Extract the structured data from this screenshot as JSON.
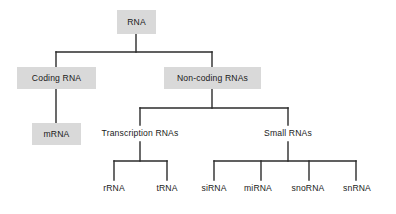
{
  "diagram": {
    "canvas": {
      "width": 396,
      "height": 214,
      "background": "#ffffff"
    },
    "style": {
      "box_fill": "#d9d9d9",
      "text_color": "#1a1a1a",
      "line_color": "#2b2b2b",
      "line_width": 1.4
    },
    "nodes": [
      {
        "id": "rna",
        "label": "RNA",
        "boxed": true,
        "x": 117,
        "y": 10,
        "w": 39,
        "h": 24
      },
      {
        "id": "coding_rna",
        "label": "Coding RNA",
        "boxed": true,
        "x": 17,
        "y": 67,
        "w": 79,
        "h": 22
      },
      {
        "id": "non_coding_rnas",
        "label": "Non-coding RNAs",
        "boxed": true,
        "x": 164,
        "y": 67,
        "w": 97,
        "h": 22
      },
      {
        "id": "mrna",
        "label": "mRNA",
        "boxed": true,
        "x": 32,
        "y": 123,
        "w": 49,
        "h": 22
      },
      {
        "id": "transcription_rnas",
        "label": "Transcription RNAs",
        "boxed": false,
        "x": 92,
        "y": 125,
        "w": 96,
        "h": 17
      },
      {
        "id": "small_rnas",
        "label": "Small RNAs",
        "boxed": false,
        "x": 256,
        "y": 125,
        "w": 64,
        "h": 17
      },
      {
        "id": "rrna",
        "label": "rRNA",
        "boxed": false,
        "x": 95,
        "y": 180,
        "w": 38,
        "h": 16
      },
      {
        "id": "trna",
        "label": "tRNA",
        "boxed": false,
        "x": 148,
        "y": 180,
        "w": 38,
        "h": 16
      },
      {
        "id": "sirna",
        "label": "siRNA",
        "boxed": false,
        "x": 193,
        "y": 180,
        "w": 42,
        "h": 16
      },
      {
        "id": "mirna",
        "label": "miRNA",
        "boxed": false,
        "x": 236,
        "y": 180,
        "w": 44,
        "h": 16
      },
      {
        "id": "snorna",
        "label": "snoRNA",
        "boxed": false,
        "x": 283,
        "y": 180,
        "w": 50,
        "h": 16
      },
      {
        "id": "snrna",
        "label": "snRNA",
        "boxed": false,
        "x": 334,
        "y": 180,
        "w": 46,
        "h": 16
      }
    ],
    "edges": [
      {
        "id": "rna-stem",
        "from": "rna",
        "to": "split-1",
        "points": "136,34 136,52"
      },
      {
        "id": "rna-bar",
        "from": "rna",
        "to": "children-bar-1",
        "points": "56,52 212,52"
      },
      {
        "id": "rna-to-coding",
        "from": "rna",
        "to": "coding_rna",
        "points": "56,52 56,67"
      },
      {
        "id": "rna-to-noncoding",
        "from": "rna",
        "to": "non_coding_rnas",
        "points": "212,52 212,67"
      },
      {
        "id": "coding-to-mrna",
        "from": "coding_rna",
        "to": "mrna",
        "points": "56,89 56,123"
      },
      {
        "id": "noncoding-stem",
        "from": "non_coding_rnas",
        "to": "split-2",
        "points": "212,89 212,108"
      },
      {
        "id": "noncoding-bar",
        "from": "non_coding_rnas",
        "to": "children-bar-2",
        "points": "140,108 288,108"
      },
      {
        "id": "noncoding-to-transc",
        "from": "non_coding_rnas",
        "to": "transcription_rnas",
        "points": "140,108 140,125"
      },
      {
        "id": "noncoding-to-small",
        "from": "non_coding_rnas",
        "to": "small_rnas",
        "points": "288,108 288,125"
      },
      {
        "id": "transc-stem",
        "from": "transcription_rnas",
        "to": "split-3",
        "points": "140,142 140,161"
      },
      {
        "id": "transc-bar",
        "from": "transcription_rnas",
        "to": "children-bar-3",
        "points": "114,161 167,161"
      },
      {
        "id": "transc-to-rrna",
        "from": "transcription_rnas",
        "to": "rrna",
        "points": "114,161 114,180"
      },
      {
        "id": "transc-to-trna",
        "from": "transcription_rnas",
        "to": "trna",
        "points": "167,161 167,180"
      },
      {
        "id": "small-stem",
        "from": "small_rnas",
        "to": "split-4",
        "points": "288,142 288,161"
      },
      {
        "id": "small-bar",
        "from": "small_rnas",
        "to": "children-bar-4",
        "points": "214,161 356,161"
      },
      {
        "id": "small-to-sirna",
        "from": "small_rnas",
        "to": "sirna",
        "points": "214,161 214,180"
      },
      {
        "id": "small-to-mirna",
        "from": "small_rnas",
        "to": "mirna",
        "points": "261,161 261,180"
      },
      {
        "id": "small-to-snorna",
        "from": "small_rnas",
        "to": "snorna",
        "points": "309,161 309,180"
      },
      {
        "id": "small-to-snrna",
        "from": "small_rnas",
        "to": "snrna",
        "points": "356,161 356,180"
      }
    ]
  }
}
